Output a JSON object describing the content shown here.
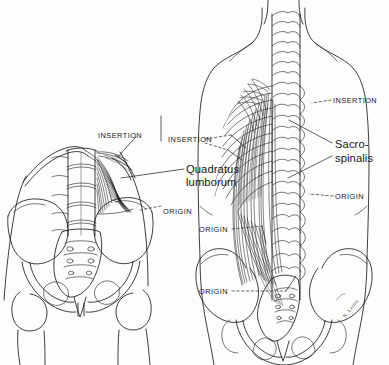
{
  "figure": {
    "background_color": "#fdfdfc",
    "ink_color": "#16161a",
    "artist_signature": "N. Lerma"
  },
  "labels": [
    {
      "id": "left-insertion",
      "text": "INSERTION",
      "style": "caps",
      "x": 98,
      "y": 132
    },
    {
      "id": "mid-insertion",
      "text": "INSERTION",
      "style": "caps",
      "x": 168,
      "y": 136
    },
    {
      "id": "quadratus-lumborum-l1",
      "text": "Quadratus",
      "style": "name",
      "x": 186,
      "y": 163
    },
    {
      "id": "quadratus-lumborum-l2",
      "text": "lumborum",
      "style": "name",
      "x": 186,
      "y": 176
    },
    {
      "id": "left-origin",
      "text": "ORIGIN",
      "style": "caps",
      "x": 163,
      "y": 208
    },
    {
      "id": "right-insertion",
      "text": "INSERTION",
      "style": "caps",
      "x": 333,
      "y": 97
    },
    {
      "id": "sacrospinalis-l1",
      "text": "Sacro-",
      "style": "name",
      "x": 335,
      "y": 138
    },
    {
      "id": "sacrospinalis-l2",
      "text": "spinalis",
      "style": "name",
      "x": 335,
      "y": 152
    },
    {
      "id": "right-origin",
      "text": "ORIGIN",
      "style": "caps",
      "x": 335,
      "y": 193
    },
    {
      "id": "pelvis-origin-upper",
      "text": "ORIGIN",
      "style": "caps",
      "x": 199,
      "y": 226
    },
    {
      "id": "pelvis-origin-lower",
      "text": "ORIGIN",
      "style": "caps",
      "x": 199,
      "y": 288
    }
  ],
  "anatomy": {
    "left_figure": {
      "name": "quadratus-lumborum-posterior-view",
      "structures": [
        "12th rib",
        "lumbar vertebrae L1-L5",
        "quadratus lumborum muscle",
        "ilium",
        "sacrum",
        "pubis",
        "femoral heads"
      ]
    },
    "right_figure": {
      "name": "sacrospinalis-posterior-torso-view",
      "structures": [
        "cervical vertebrae",
        "thoracic vertebrae",
        "ribs",
        "erector spinae muscle group",
        "lumbar vertebrae",
        "sacrum",
        "ilium",
        "pelvis"
      ]
    }
  }
}
